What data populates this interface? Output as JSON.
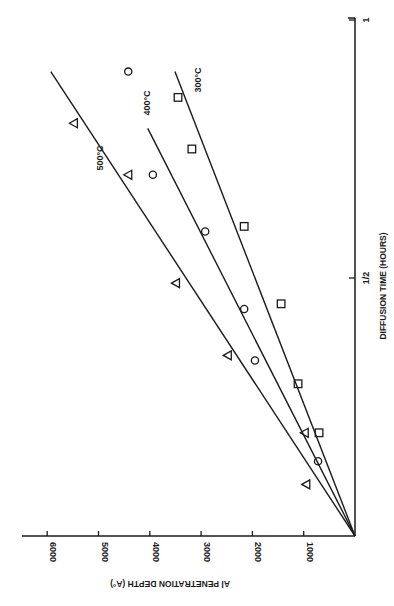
{
  "chart_data": {
    "type": "scatter",
    "title": "",
    "orientation": "rotated-90",
    "xlabel": "DIFFUSION TIME (HOURS)",
    "ylabel": "Al PENETRATION DEPTH (A°)",
    "x_ticks": [
      {
        "value": 0.5,
        "label": "1/2"
      },
      {
        "value": 1.0,
        "label": "1"
      }
    ],
    "y_ticks": [
      {
        "value": 1000,
        "label": "1000"
      },
      {
        "value": 2000,
        "label": "2000"
      },
      {
        "value": 3000,
        "label": "3000"
      },
      {
        "value": 4000,
        "label": "4000"
      },
      {
        "value": 5000,
        "label": "5000"
      },
      {
        "value": 6000,
        "label": "6000"
      }
    ],
    "xlim": [
      0,
      1
    ],
    "ylim": [
      0,
      6500
    ],
    "grid": false,
    "legend": "inline line labels",
    "series": [
      {
        "name": "500°C",
        "marker": "triangle",
        "points": [
          {
            "x": 0.1,
            "y": 950
          },
          {
            "x": 0.2,
            "y": 980
          },
          {
            "x": 0.35,
            "y": 2480
          },
          {
            "x": 0.49,
            "y": 3490
          },
          {
            "x": 0.7,
            "y": 4420
          },
          {
            "x": 0.8,
            "y": 5480
          }
        ],
        "fit_line": {
          "x": [
            0,
            0.9
          ],
          "y": [
            0,
            5930
          ]
        }
      },
      {
        "name": "400°C",
        "marker": "circle",
        "points": [
          {
            "x": 0.145,
            "y": 720
          },
          {
            "x": 0.34,
            "y": 1950
          },
          {
            "x": 0.44,
            "y": 2160
          },
          {
            "x": 0.59,
            "y": 2920
          },
          {
            "x": 0.7,
            "y": 3940
          },
          {
            "x": 0.9,
            "y": 4420
          }
        ],
        "fit_line": {
          "x": [
            0,
            0.79
          ],
          "y": [
            0,
            4040
          ]
        }
      },
      {
        "name": "300°C",
        "marker": "square",
        "points": [
          {
            "x": 0.2,
            "y": 700
          },
          {
            "x": 0.295,
            "y": 1110
          },
          {
            "x": 0.45,
            "y": 1440
          },
          {
            "x": 0.6,
            "y": 2160
          },
          {
            "x": 0.75,
            "y": 3180
          },
          {
            "x": 0.85,
            "y": 3450
          }
        ],
        "fit_line": {
          "x": [
            0,
            0.9
          ],
          "y": [
            0,
            3510
          ]
        }
      }
    ]
  },
  "layout": {
    "origin_px": [
      355,
      536
    ],
    "px_per_hour": 516,
    "px_per_1000A": 51.3,
    "time_axis_end_px_y": 18,
    "depth_axis_end_px_x": 22
  },
  "labels": {
    "series_500": "500°C",
    "series_400": "400°C",
    "series_300": "300°C"
  },
  "colors": {
    "ink": "#1a1a1a",
    "background": "#ffffff"
  }
}
